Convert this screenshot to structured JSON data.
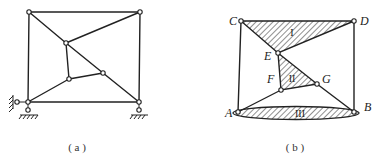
{
  "figures": [
    {
      "id": "a",
      "caption": "( a )",
      "nodes": {
        "TL": [
          29,
          12
        ],
        "TR": [
          140,
          12
        ],
        "E": [
          66,
          43
        ],
        "G": [
          103,
          73
        ],
        "F": [
          69,
          79
        ],
        "A": [
          28,
          102
        ],
        "B": [
          139,
          102
        ]
      },
      "members": [
        [
          "TL",
          "TR"
        ],
        [
          "TL",
          "A"
        ],
        [
          "TR",
          "B"
        ],
        [
          "A",
          "B"
        ],
        [
          "TL",
          "E"
        ],
        [
          "E",
          "TR"
        ],
        [
          "E",
          "G"
        ],
        [
          "G",
          "B"
        ],
        [
          "E",
          "F"
        ],
        [
          "F",
          "G"
        ],
        [
          "F",
          "A"
        ]
      ],
      "supports": [
        "pin-A",
        "roller-horizontal-A",
        "pin-B"
      ]
    },
    {
      "id": "b",
      "caption": "( b )",
      "nodes": {
        "C": [
          241,
          21
        ],
        "D": [
          354,
          21
        ],
        "E": [
          278,
          53
        ],
        "F": [
          281,
          90
        ],
        "G": [
          317,
          84
        ],
        "A": [
          238,
          112
        ],
        "B": [
          354,
          112
        ]
      },
      "labels": {
        "C": "C",
        "D": "D",
        "E": "E",
        "F": "F",
        "G": "G",
        "A": "A",
        "B": "B"
      },
      "rigid_bodies": [
        {
          "name": "I",
          "label": "I",
          "shape": "triangle C-D-E"
        },
        {
          "name": "II",
          "label": "II",
          "shape": "triangle E-F-G"
        },
        {
          "name": "III",
          "label": "III",
          "shape": "ellipse (ground A-B)"
        }
      ],
      "members": [
        [
          "C",
          "A"
        ],
        [
          "D",
          "B"
        ],
        [
          "G",
          "B"
        ],
        [
          "F",
          "A"
        ]
      ]
    }
  ]
}
